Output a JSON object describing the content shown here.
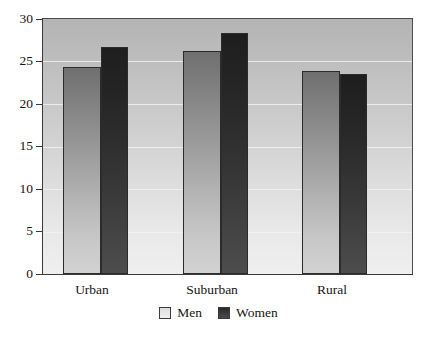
{
  "chart_data": {
    "type": "bar",
    "title": "",
    "subtitle": "",
    "xlabel": "",
    "ylabel": "",
    "categories": [
      "Urban",
      "Suburban",
      "Rural"
    ],
    "series": [
      {
        "name": "Men",
        "color": "#a0a0a0",
        "values": [
          24.4,
          26.2,
          23.9
        ]
      },
      {
        "name": "Women",
        "color": "#2d2d2d",
        "values": [
          26.7,
          28.4,
          23.5
        ]
      }
    ],
    "ylim": [
      0,
      30
    ],
    "ytick_labels": [
      "0",
      "5",
      "10",
      "15",
      "20",
      "25",
      "30"
    ],
    "ytick_values": [
      0,
      5,
      10,
      15,
      20,
      25,
      30
    ],
    "grid": true,
    "grid_axis": "y",
    "legend_position": "bottom-center",
    "annotations": []
  },
  "legend": {
    "items": [
      {
        "label": "Men",
        "swatch": "men-swatch"
      },
      {
        "label": "Women",
        "swatch": "women-swatch"
      }
    ]
  },
  "axis": {
    "y_labels": [
      "30",
      "25",
      "20",
      "15",
      "10",
      "5",
      "0"
    ],
    "x_labels": [
      "Urban",
      "Suburban",
      "Rural"
    ]
  }
}
